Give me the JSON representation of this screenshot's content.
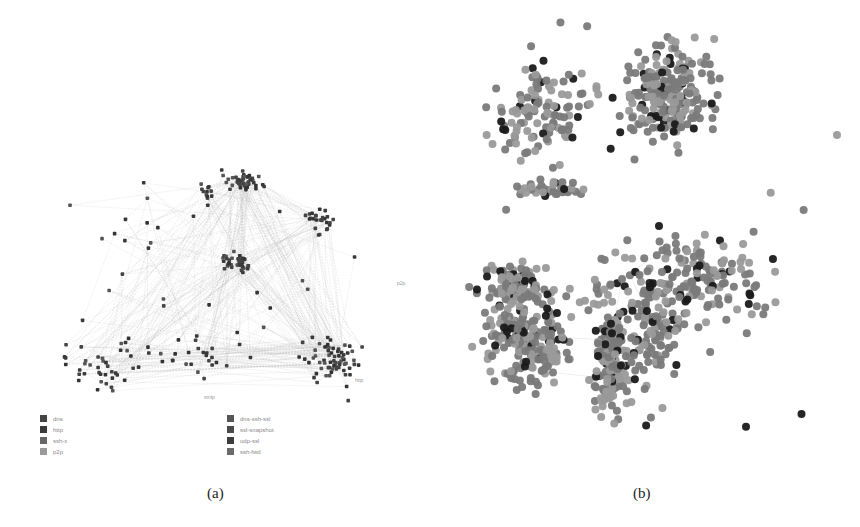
{
  "figure": {
    "panel_a": {
      "caption": "(a)",
      "legend_left": [
        {
          "label": "dns",
          "color": "#444444"
        },
        {
          "label": "http",
          "color": "#3a3a3a"
        },
        {
          "label": "ssh-x",
          "color": "#666666"
        },
        {
          "label": "p2p",
          "color": "#9a9a9a"
        }
      ],
      "legend_right": [
        {
          "label": "dns-ssh-ssl",
          "color": "#555555"
        },
        {
          "label": "ssl-snapshot",
          "color": "#4a4a4a"
        },
        {
          "label": "udp-ssl",
          "color": "#3c3c3c"
        },
        {
          "label": "ssh-fwd",
          "color": "#6a6a6a"
        }
      ],
      "node_labels": [
        "p2p",
        "http",
        "smtp"
      ]
    },
    "panel_b": {
      "caption": "(b)",
      "node_colors": {
        "dark": "#1a1a1a",
        "mid": "#7a7a7a",
        "light": "#9a9a9a"
      }
    }
  }
}
